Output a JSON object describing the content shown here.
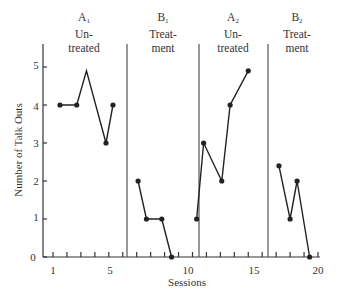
{
  "chart_data": {
    "type": "line",
    "title": "",
    "xlabel": "Sessions",
    "ylabel": "Number of Talk Outs",
    "xlim": [
      0,
      20.5
    ],
    "ylim": [
      0,
      5.5
    ],
    "x_ticks": [
      1,
      5,
      10,
      15,
      20
    ],
    "y_ticks": [
      0,
      1,
      2,
      3,
      4,
      5
    ],
    "grid": false,
    "legend": null,
    "phases": [
      {
        "id": "A1",
        "label": "A",
        "sub": "1",
        "desc_line1": "Un-",
        "desc_line2": "treated",
        "start_after": 0
      },
      {
        "id": "B1",
        "label": "B",
        "sub": "1",
        "desc_line1": "Treat-",
        "desc_line2": "ment",
        "start_after": 6.5
      },
      {
        "id": "A2",
        "label": "A",
        "sub": "2",
        "desc_line1": "Un-",
        "desc_line2": "treated",
        "start_after": 10.5
      },
      {
        "id": "B2",
        "label": "B",
        "sub": "2",
        "desc_line1": "Treat-",
        "desc_line2": "ment",
        "start_after": 16.0
      }
    ],
    "phase_boundaries": [
      6.5,
      10.5,
      16.0
    ],
    "series": [
      {
        "name": "A1",
        "points": [
          [
            1.5,
            4
          ],
          [
            2.7,
            4
          ],
          [
            3.4,
            4.9
          ],
          [
            4.8,
            3
          ],
          [
            5.3,
            4
          ]
        ],
        "markers": [
          true,
          true,
          false,
          true,
          true
        ]
      },
      {
        "name": "B1",
        "points": [
          [
            7.1,
            2
          ],
          [
            7.7,
            1
          ],
          [
            8.8,
            1
          ],
          [
            9.5,
            0
          ]
        ],
        "markers": [
          true,
          true,
          true,
          true
        ]
      },
      {
        "name": "A2",
        "points": [
          [
            11.3,
            1
          ],
          [
            11.8,
            3
          ],
          [
            13.1,
            2
          ],
          [
            13.7,
            4
          ],
          [
            15.0,
            4.9
          ]
        ],
        "markers": [
          true,
          true,
          true,
          true,
          true
        ]
      },
      {
        "name": "B2",
        "points": [
          [
            17.2,
            2.4
          ],
          [
            18.0,
            1
          ],
          [
            18.5,
            2
          ],
          [
            19.4,
            0
          ]
        ],
        "markers": [
          true,
          true,
          true,
          true
        ]
      }
    ]
  },
  "labels": {
    "x_title": "Sessions",
    "y_title": "Number of Talk Outs",
    "x_tick_1": "1",
    "x_tick_5": "5",
    "x_tick_10": "10",
    "x_tick_15": "15",
    "x_tick_20": "20",
    "y_tick_0": "0",
    "y_tick_1": "1",
    "y_tick_2": "2",
    "y_tick_3": "3",
    "y_tick_4": "4",
    "y_tick_5": "5",
    "phase_a1": "A",
    "phase_a1_sub": "1",
    "phase_b1": "B",
    "phase_b1_sub": "1",
    "phase_a2": "A",
    "phase_a2_sub": "2",
    "phase_b2": "B",
    "phase_b2_sub": "2",
    "untreated_1": "Un-",
    "untreated_2": "treated",
    "treatment_1": "Treat-",
    "treatment_2": "ment"
  }
}
